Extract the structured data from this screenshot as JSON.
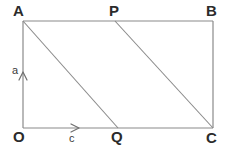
{
  "figure": {
    "background_color": "#ffffff",
    "line_color": "#8a8a8a",
    "label_color": "#2b2b2b",
    "vector_label_color": "#3a3a3a",
    "vertices": [
      {
        "id": "A",
        "label": "A",
        "x": 23,
        "y": 21
      },
      {
        "id": "P",
        "label": "P",
        "x": 115,
        "y": 21
      },
      {
        "id": "B",
        "label": "B",
        "x": 213,
        "y": 21
      },
      {
        "id": "O",
        "label": "O",
        "x": 23,
        "y": 128
      },
      {
        "id": "Q",
        "label": "Q",
        "x": 118,
        "y": 128
      },
      {
        "id": "C",
        "label": "C",
        "x": 213,
        "y": 128
      }
    ],
    "edges": [
      {
        "id": "AB",
        "from": "A",
        "to": "B",
        "kind": "rectangle-top"
      },
      {
        "id": "OC",
        "from": "O",
        "to": "C",
        "kind": "rectangle-bottom"
      },
      {
        "id": "AO",
        "from": "A",
        "to": "O",
        "kind": "rectangle-left"
      },
      {
        "id": "BC",
        "from": "B",
        "to": "C",
        "kind": "rectangle-right"
      },
      {
        "id": "AQ",
        "from": "A",
        "to": "Q",
        "kind": "diagonal"
      },
      {
        "id": "PC",
        "from": "P",
        "to": "C",
        "kind": "diagonal"
      }
    ],
    "vectors": [
      {
        "id": "a",
        "label": "a",
        "direction": "up",
        "along": "AO",
        "arrow_tip_x": 23,
        "arrow_tip_y": 72
      },
      {
        "id": "c",
        "label": "c",
        "direction": "right",
        "along": "OC",
        "arrow_tip_x": 79,
        "arrow_tip_y": 128
      }
    ]
  }
}
